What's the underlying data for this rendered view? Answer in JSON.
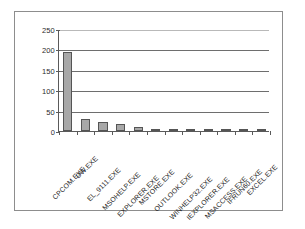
{
  "figure": {
    "frame_border_color": "#8d8d8d",
    "background": "#ffffff"
  },
  "chart_data": {
    "type": "bar",
    "title": "",
    "subtitle": "",
    "xlabel": "",
    "ylabel": "",
    "ylim": [
      0,
      250
    ],
    "yticks": [
      0,
      50,
      100,
      150,
      200,
      250
    ],
    "ytick_labels": [
      "0",
      "50",
      "100",
      "150",
      "200",
      "250"
    ],
    "grid": true,
    "grid_axis": "y",
    "legend": false,
    "legend_position": "none",
    "bar_fill_color": "#a8a8a8",
    "bar_edge_color": "#555555",
    "axis_color": "#5a5a5a",
    "gridline_color": "#6e6e6e",
    "categories": [
      "CPCOM.EXE",
      "DW.EXE",
      "EL_9111.EXE",
      "MSOHELP.EXE",
      "EXPLORER.EXE",
      "MSTORE.EXE",
      "OUTLOOK.EXE",
      "WINHELP32.EXE",
      "IEXPLORER.EXE",
      "MSACCESS.EXE",
      "IFRUN60.EXE",
      "EXCEL.EXE"
    ],
    "values": [
      193,
      30,
      22,
      17,
      11,
      4,
      2,
      1.5,
      1.5,
      1,
      1,
      1.5
    ]
  }
}
